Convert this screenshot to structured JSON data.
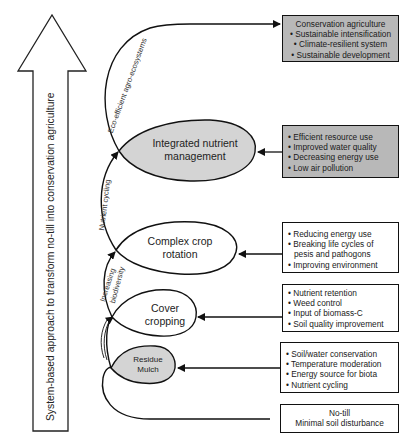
{
  "vertical_arrow": {
    "label": "System-based approach to transform  no-till into conservation agriculture"
  },
  "stages": [
    {
      "id": "residue-mulch",
      "label_line1": "Residue",
      "label_line2": "Mulch",
      "fill": "#d4d4d4"
    },
    {
      "id": "cover-cropping",
      "label_line1": "Cover",
      "label_line2": "cropping",
      "fill": "#ffffff"
    },
    {
      "id": "complex-crop-rotation",
      "label_line1": "Complex crop",
      "label_line2": "rotation",
      "fill": "#ffffff"
    },
    {
      "id": "integrated-nutrient-management",
      "label_line1": "Integrated nutrient",
      "label_line2": "management",
      "fill": "#d4d4d4"
    }
  ],
  "arc_labels": {
    "eco_efficient": "Eco-efficient agro-ecosystems",
    "nutrient_cycling": "Nutrient cycling",
    "increasing": "Increasing",
    "biodiversity": "biodiversity",
    "residue_small": "(illegible small text)"
  },
  "boxes": {
    "conservation": {
      "title": "Conservation agriculture",
      "items": [
        "Sustainable intensification",
        "Climate-resilient system",
        "Sustainable development"
      ]
    },
    "inm": {
      "items": [
        "Efficient resource use",
        "Improved water quality",
        "Decreasing energy use",
        "Low air pollution"
      ]
    },
    "rotation": {
      "items": [
        "Reducing energy use",
        "Breaking life cycles of pesis and pathogons",
        "Improving environment"
      ]
    },
    "cover": {
      "items": [
        "Nutrient retention",
        "Weed control",
        "Input of biomass-C",
        "Soil quality improvement"
      ]
    },
    "mulch": {
      "items": [
        "Soil/water conservation",
        "Temperature moderation",
        "Energy source for biota",
        "Nutrient cycling"
      ]
    },
    "notill": {
      "line1": "No-till",
      "line2": "Minimal soil disturbance"
    }
  },
  "colors": {
    "gray_box": "#b8b8b8",
    "gray_ellipse": "#d4d4d4",
    "stroke": "#111111"
  }
}
